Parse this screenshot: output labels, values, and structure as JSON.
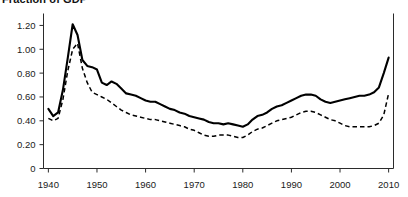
{
  "chart_data": {
    "type": "line",
    "title": "Fraction of GDP",
    "xlabel": "",
    "ylabel": "",
    "xlim": [
      1939,
      2011
    ],
    "ylim": [
      0,
      1.3
    ],
    "grid": false,
    "legend_position": "none",
    "x_ticks": [
      "1940",
      "1950",
      "1960",
      "1970",
      "1980",
      "1990",
      "2000",
      "2010"
    ],
    "x_tick_values": [
      1940,
      1950,
      1960,
      1970,
      1980,
      1990,
      2000,
      2010
    ],
    "y_ticks": [
      "0",
      "0.20",
      "0.40",
      "0.60",
      "0.80",
      "1.00",
      "1.20"
    ],
    "y_tick_values": [
      0,
      0.2,
      0.4,
      0.6,
      0.8,
      1.0,
      1.2
    ],
    "x": [
      1940,
      1941,
      1942,
      1943,
      1944,
      1945,
      1946,
      1947,
      1948,
      1949,
      1950,
      1951,
      1952,
      1953,
      1954,
      1955,
      1956,
      1957,
      1958,
      1959,
      1960,
      1961,
      1962,
      1963,
      1964,
      1965,
      1966,
      1967,
      1968,
      1969,
      1970,
      1971,
      1972,
      1973,
      1974,
      1975,
      1976,
      1977,
      1978,
      1979,
      1980,
      1981,
      1982,
      1983,
      1984,
      1985,
      1986,
      1987,
      1988,
      1989,
      1990,
      1991,
      1992,
      1993,
      1994,
      1995,
      1996,
      1997,
      1998,
      1999,
      2000,
      2001,
      2002,
      2003,
      2004,
      2005,
      2006,
      2007,
      2008,
      2009,
      2010
    ],
    "series": [
      {
        "name": "solid-series",
        "style": "solid",
        "color": "#000000",
        "values": [
          0.5,
          0.44,
          0.47,
          0.66,
          0.93,
          1.21,
          1.12,
          0.91,
          0.86,
          0.85,
          0.83,
          0.72,
          0.7,
          0.73,
          0.71,
          0.67,
          0.63,
          0.62,
          0.61,
          0.59,
          0.57,
          0.56,
          0.56,
          0.54,
          0.52,
          0.5,
          0.49,
          0.47,
          0.46,
          0.44,
          0.43,
          0.42,
          0.41,
          0.39,
          0.38,
          0.38,
          0.37,
          0.38,
          0.37,
          0.36,
          0.35,
          0.37,
          0.41,
          0.44,
          0.45,
          0.47,
          0.5,
          0.52,
          0.53,
          0.55,
          0.57,
          0.59,
          0.61,
          0.62,
          0.62,
          0.61,
          0.58,
          0.56,
          0.55,
          0.56,
          0.57,
          0.58,
          0.59,
          0.6,
          0.61,
          0.61,
          0.62,
          0.64,
          0.68,
          0.8,
          0.93
        ]
      },
      {
        "name": "dashed-series",
        "style": "dashed",
        "color": "#000000",
        "values": [
          0.42,
          0.4,
          0.42,
          0.58,
          0.82,
          1.0,
          1.05,
          0.84,
          0.72,
          0.64,
          0.62,
          0.6,
          0.58,
          0.55,
          0.52,
          0.49,
          0.47,
          0.45,
          0.44,
          0.43,
          0.42,
          0.41,
          0.41,
          0.4,
          0.39,
          0.38,
          0.37,
          0.36,
          0.35,
          0.33,
          0.32,
          0.3,
          0.28,
          0.27,
          0.27,
          0.28,
          0.28,
          0.28,
          0.27,
          0.26,
          0.26,
          0.28,
          0.31,
          0.33,
          0.34,
          0.36,
          0.38,
          0.4,
          0.41,
          0.42,
          0.43,
          0.45,
          0.47,
          0.48,
          0.48,
          0.47,
          0.45,
          0.43,
          0.41,
          0.4,
          0.38,
          0.36,
          0.35,
          0.35,
          0.35,
          0.35,
          0.35,
          0.36,
          0.38,
          0.45,
          0.63
        ]
      }
    ]
  }
}
